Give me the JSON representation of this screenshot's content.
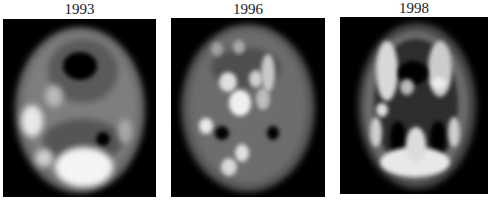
{
  "figure": {
    "panels": [
      {
        "label": "1993",
        "description": "Blurry brain scan, axial slice, low resolution with large bright regions"
      },
      {
        "label": "1996",
        "description": "Brain scan, axial slice, patchy bright spots with irregular edges"
      },
      {
        "label": "1998",
        "description": "Brain scan, axial slice, detailed cortical ribbon and ventricles"
      }
    ]
  }
}
